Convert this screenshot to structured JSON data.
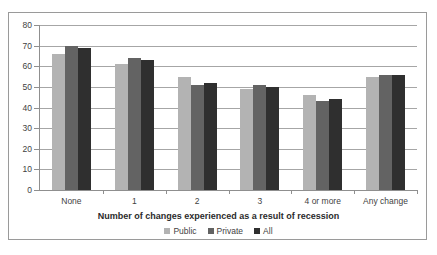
{
  "chart_data": {
    "type": "bar",
    "title": "",
    "xlabel": "Number of changes experienced as a result of recession",
    "ylabel": "",
    "categories": [
      "None",
      "1",
      "2",
      "3",
      "4 or more",
      "Any change"
    ],
    "series": [
      {
        "name": "Public",
        "values": [
          66,
          61,
          55,
          49,
          46,
          55
        ],
        "color": "#b3b3b3"
      },
      {
        "name": "Private",
        "values": [
          70,
          64,
          51,
          51,
          43,
          56
        ],
        "color": "#636363"
      },
      {
        "name": "All",
        "values": [
          69,
          63,
          52,
          50,
          44,
          56
        ],
        "color": "#2f2f2f"
      }
    ],
    "ylim": [
      0,
      80
    ],
    "ytick_step": 10,
    "yticks": [
      "80",
      "70",
      "60",
      "50",
      "40",
      "30",
      "20",
      "10",
      "0"
    ],
    "grid": true,
    "legend_position": "bottom"
  }
}
